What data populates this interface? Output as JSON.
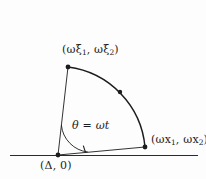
{
  "figure": {
    "background_color": "#fdfdfd",
    "stroke_color": "#1c1c1c",
    "labels": {
      "upper_point": "(ωξ₁, ωξ₂)",
      "upper_point_parts": {
        "open": "(ωξ",
        "sub1": "1",
        "mid": ", ωξ",
        "sub2": "2",
        "close": ")"
      },
      "right_point": "(ωx₁, ωx₂)",
      "right_point_parts": {
        "open": "(ωx",
        "sub1": "1",
        "mid": ", ωx",
        "sub2": "2",
        "close": ")"
      },
      "angle": "θ = ωt",
      "angle_parts": {
        "theta": "θ",
        "equals": " = ",
        "omega_t": "ωt"
      },
      "origin_point": "(Δ, 0)",
      "origin_point_parts": {
        "open": "(",
        "delta": "Δ",
        "close": ", 0)"
      }
    },
    "geometry": {
      "vertex": [
        58,
        155
      ],
      "upper_endpoint": [
        68,
        67
      ],
      "right_endpoint": [
        145,
        147
      ],
      "arc_mid_dot": [
        120,
        92
      ],
      "radius": 88,
      "angle_arc_radius": 30,
      "baseline_y": 155,
      "baseline_x_start": 10,
      "baseline_x_end": 198,
      "theta_start_deg": 5.9,
      "theta_end_deg": 83.5
    }
  }
}
